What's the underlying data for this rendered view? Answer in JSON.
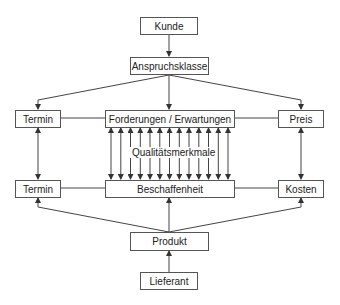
{
  "diagram": {
    "nodes": {
      "kunde": "Kunde",
      "anspruchsklasse": "Anspruchsklasse",
      "termin_top": "Termin",
      "forderungen": "Forderungen / Erwartungen",
      "preis": "Preis",
      "qualitaetsmerkmale": "Qualitätsmerkmale",
      "termin_bottom": "Termin",
      "beschaffenheit": "Beschaffenheit",
      "kosten": "Kosten",
      "produkt": "Produkt",
      "lieferant": "Lieferant"
    },
    "edges": [
      {
        "from": "Kunde",
        "to": "Anspruchsklasse",
        "type": "arrow"
      },
      {
        "from": "Anspruchsklasse",
        "to": "Termin",
        "type": "arrow"
      },
      {
        "from": "Anspruchsklasse",
        "to": "Forderungen / Erwartungen",
        "type": "arrow"
      },
      {
        "from": "Anspruchsklasse",
        "to": "Preis",
        "type": "arrow"
      },
      {
        "from": "Termin",
        "to": "Forderungen / Erwartungen",
        "type": "line"
      },
      {
        "from": "Forderungen / Erwartungen",
        "to": "Preis",
        "type": "line"
      },
      {
        "from": "Termin",
        "to": "Termin",
        "type": "double-arrow"
      },
      {
        "from": "Forderungen / Erwartungen",
        "to": "Beschaffenheit",
        "type": "double-arrow",
        "count": 13,
        "label": "Qualitätsmerkmale"
      },
      {
        "from": "Preis",
        "to": "Kosten",
        "type": "double-arrow"
      },
      {
        "from": "Termin",
        "to": "Beschaffenheit",
        "type": "line"
      },
      {
        "from": "Beschaffenheit",
        "to": "Kosten",
        "type": "line"
      },
      {
        "from": "Produkt",
        "to": "Termin",
        "type": "arrow"
      },
      {
        "from": "Produkt",
        "to": "Beschaffenheit",
        "type": "arrow"
      },
      {
        "from": "Produkt",
        "to": "Kosten",
        "type": "arrow"
      },
      {
        "from": "Lieferant",
        "to": "Produkt",
        "type": "arrow"
      }
    ]
  }
}
